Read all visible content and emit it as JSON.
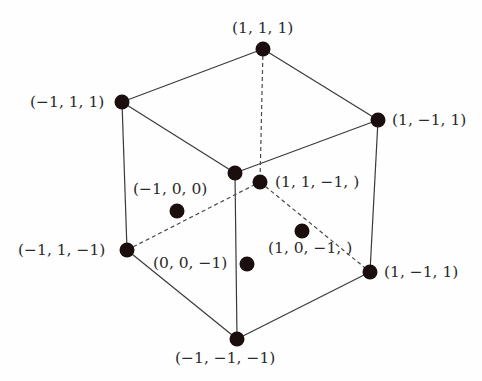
{
  "diagram": {
    "points": [
      {
        "id": "p-top",
        "label": "(1, 1, 1)",
        "x": 263,
        "y": 49,
        "lx": 232,
        "ly": 33
      },
      {
        "id": "p-left-top",
        "label": "(−1, 1, 1)",
        "x": 122,
        "y": 102,
        "lx": 30,
        "ly": 107
      },
      {
        "id": "p-right-top",
        "label": "(1, −1, 1)",
        "x": 378,
        "y": 120,
        "lx": 392,
        "ly": 125
      },
      {
        "id": "p-center-top",
        "label": "",
        "x": 235,
        "y": 173,
        "lx": 0,
        "ly": 0
      },
      {
        "id": "p-back-center",
        "label": "(1, 1, −1, )",
        "x": 260,
        "y": 182,
        "lx": 275,
        "ly": 187
      },
      {
        "id": "p-face-left",
        "label": "(−1, 0, 0)",
        "x": 177,
        "y": 211,
        "lx": 133,
        "ly": 194
      },
      {
        "id": "p-face-right",
        "label": "(1, 0, −1, )",
        "x": 302,
        "y": 231,
        "lx": 268,
        "ly": 253
      },
      {
        "id": "p-left-bottom",
        "label": "(−1, 1, −1)",
        "x": 127,
        "y": 250,
        "lx": 18,
        "ly": 255
      },
      {
        "id": "p-face-bottom",
        "label": "(0, 0, −1)",
        "x": 247,
        "y": 264,
        "lx": 153,
        "ly": 268
      },
      {
        "id": "p-right-bottom",
        "label": "(1, −1, 1)",
        "x": 370,
        "y": 272,
        "lx": 384,
        "ly": 277
      },
      {
        "id": "p-bottom",
        "label": "(−1, −1, −1)",
        "x": 237,
        "y": 339,
        "lx": 175,
        "ly": 363
      }
    ],
    "edges_solid": [
      [
        "p-top",
        "p-left-top"
      ],
      [
        "p-top",
        "p-right-top"
      ],
      [
        "p-left-top",
        "p-center-top"
      ],
      [
        "p-right-top",
        "p-center-top"
      ],
      [
        "p-left-top",
        "p-left-bottom"
      ],
      [
        "p-right-top",
        "p-right-bottom"
      ],
      [
        "p-center-top",
        "p-bottom"
      ],
      [
        "p-left-bottom",
        "p-bottom"
      ],
      [
        "p-right-bottom",
        "p-bottom"
      ]
    ],
    "edges_dashed": [
      [
        "p-top",
        "p-back-center"
      ],
      [
        "p-left-bottom",
        "p-back-center"
      ],
      [
        "p-back-center",
        "p-right-bottom"
      ]
    ],
    "colors": {
      "point": "#1a0e0e",
      "edge": "#3a3a3a",
      "label": "#2a2a2a"
    }
  }
}
